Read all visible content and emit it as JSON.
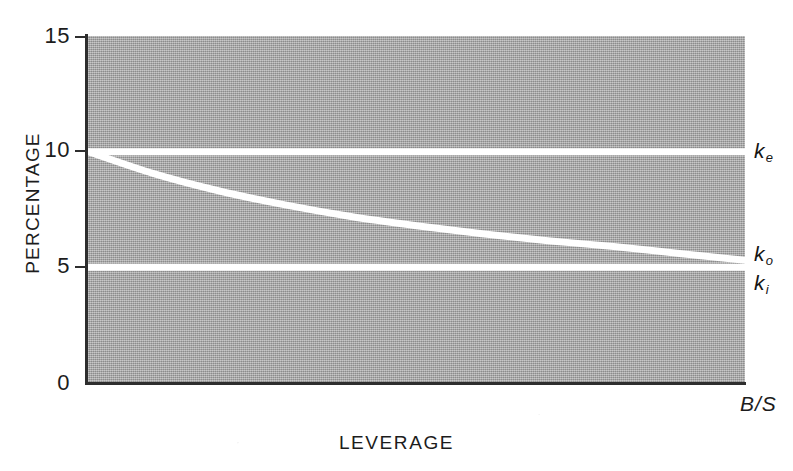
{
  "chart_data": {
    "type": "line",
    "title": "",
    "subtitle": "",
    "xlabel": "LEVERAGE",
    "ylabel": "PERCENTAGE",
    "x_end_label": "B/S",
    "xlim": [
      0,
      100
    ],
    "ylim": [
      0,
      15
    ],
    "y_ticks": [
      0,
      5,
      10,
      15
    ],
    "y_tick_labels": [
      "0",
      "5",
      "10",
      "15"
    ],
    "x_ticks": [],
    "x_tick_labels": [],
    "grid": false,
    "legend_position": "right-inline",
    "plot_background_color": "#a9a9a9",
    "series_color": "#ffffff",
    "axis_color": "#2e2e2e",
    "series": [
      {
        "name": "k_e",
        "label_base": "k",
        "label_sub": "e",
        "description": "cost of equity, constant",
        "values": [
          10.0,
          10.0,
          10.0,
          10.0,
          10.0,
          10.0,
          10.0,
          10.0,
          10.0,
          10.0,
          10.0
        ],
        "x": [
          0,
          10,
          20,
          30,
          40,
          50,
          60,
          70,
          80,
          90,
          100
        ],
        "label_y": 10.0
      },
      {
        "name": "k_o",
        "label_base": "k",
        "label_sub": "o",
        "description": "overall cost of capital, declines asymptotically toward k_i",
        "values": [
          10.0,
          9.05,
          8.3,
          7.7,
          7.2,
          6.8,
          6.45,
          6.15,
          5.9,
          5.6,
          5.3
        ],
        "x": [
          0,
          10,
          20,
          30,
          40,
          50,
          60,
          70,
          80,
          90,
          100
        ],
        "label_y": 5.55
      },
      {
        "name": "k_i",
        "label_base": "k",
        "label_sub": "i",
        "description": "cost of debt, constant",
        "values": [
          5.0,
          5.0,
          5.0,
          5.0,
          5.0,
          5.0,
          5.0,
          5.0,
          5.0,
          5.0,
          5.0
        ],
        "x": [
          0,
          10,
          20,
          30,
          40,
          50,
          60,
          70,
          80,
          90,
          100
        ],
        "label_y": 4.3
      }
    ]
  }
}
